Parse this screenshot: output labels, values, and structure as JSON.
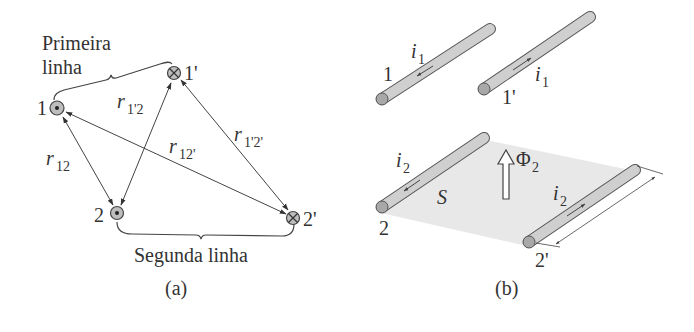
{
  "figure_a": {
    "caption": "(a)",
    "group_labels": {
      "first_line_1": "Primeira",
      "first_line_2": "linha",
      "second_line": "Segunda linha"
    },
    "nodes": [
      {
        "id": "1",
        "label": "1",
        "current": "out-of-page"
      },
      {
        "id": "1p",
        "label": "1'",
        "current": "into-page"
      },
      {
        "id": "2",
        "label": "2",
        "current": "out-of-page"
      },
      {
        "id": "2p",
        "label": "2'",
        "current": "into-page"
      }
    ],
    "distances": {
      "r12": {
        "base": "r",
        "sub": "12"
      },
      "r1p2": {
        "base": "r",
        "sub": "1'2"
      },
      "r12p": {
        "base": "r",
        "sub": "12'"
      },
      "r1p2p": {
        "base": "r",
        "sub": "1'2'"
      }
    }
  },
  "figure_b": {
    "caption": "(b)",
    "wires": [
      {
        "id": "1",
        "label": "1",
        "current_label": {
          "base": "i",
          "sub": "1"
        }
      },
      {
        "id": "1p",
        "label": "1'",
        "current_label": {
          "base": "i",
          "sub": "1"
        }
      },
      {
        "id": "2",
        "label": "2",
        "current_label": {
          "base": "i",
          "sub": "2"
        }
      },
      {
        "id": "2p",
        "label": "2'",
        "current_label": {
          "base": "i",
          "sub": "2"
        }
      }
    ],
    "surface_label": "S",
    "flux_label": {
      "base": "Φ",
      "sub": "2"
    }
  },
  "colors": {
    "rod_fill": "#cfcfcf",
    "rod_end": "#a8a8a8",
    "surface": "#e6e6e6",
    "ink": "#333333"
  }
}
